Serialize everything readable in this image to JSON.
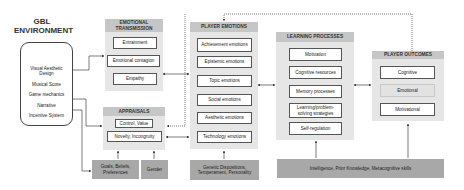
{
  "gbl_environment": {
    "title": "GBL ENVIRONMENT",
    "title_line1": "GBL",
    "title_line2": "ENVIRONMENT",
    "items": [
      "Visual Aesthetic Design",
      "Musical Score",
      "Game mechanics",
      "Narrative",
      "Incentive System"
    ]
  },
  "emotional_transmission": {
    "title": "EMOTIONAL TRANSMISSION",
    "title_line1": "EMOTIONAL",
    "title_line2": "TRANSMISSION",
    "items": [
      "Entrainment",
      "Emotional contagion",
      "Empathy"
    ]
  },
  "appraisals": {
    "title": "APPRAISALS",
    "items": [
      "Control, Value",
      "Novelty, Incongruity"
    ]
  },
  "player_emotions": {
    "title": "PLAYER EMOTIONS",
    "items": [
      "Achievement emotions",
      "Epistemic emotions",
      "Topic emotions",
      "Social emotions",
      "Aesthetic emotions",
      "Technology emotions"
    ]
  },
  "learning_processes": {
    "title": "LEARNING PROCESSES",
    "items": [
      "Motivation",
      "Cognitive resources",
      "Memory processes",
      "Learning/problem-solving strategies",
      "Self-regulation"
    ]
  },
  "player_outcomes": {
    "title": "PLAYER OUTCOMES",
    "items": [
      "Cognitive",
      "Emotional",
      "Motivational"
    ]
  },
  "individual_factors": {
    "goals": "Goals, Beliefs, Preferences",
    "gender": "Gender",
    "genetic": "Genetic Dispositions, Temperament, Personality",
    "intelligence": "Intelligence, Prior Knowledge, Metacognitive skills"
  },
  "colors": {
    "panel_bg": "#e6e6e6",
    "panel_header": "#c6c6c6",
    "factor_bg": "#a8a8a8",
    "line": "#444444"
  }
}
